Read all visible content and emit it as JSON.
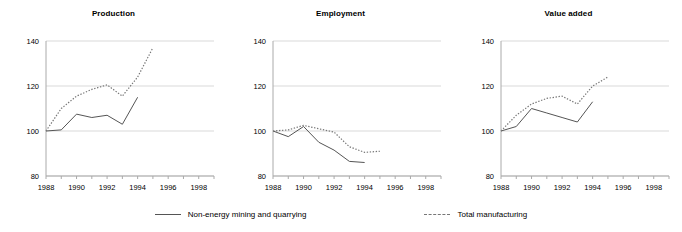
{
  "figure": {
    "background_color": "#ffffff",
    "series_colors": {
      "solid": "#555555",
      "dotted": "#777777",
      "grid": "#d9d9d9",
      "axis": "#aaaaaa"
    }
  },
  "legend": {
    "position": "bottom-center",
    "entries": [
      {
        "label": "Non-energy mining and quarrying",
        "style": "solid",
        "swatch_name": "solid-line-swatch"
      },
      {
        "label": "Total manufacturing",
        "style": "dashed",
        "swatch_name": "dashed-line-swatch"
      }
    ]
  },
  "chart_data": [
    {
      "type": "line",
      "title": "Production",
      "xlabel": "",
      "ylabel": "",
      "xlim": [
        1988,
        1999
      ],
      "ylim": [
        80,
        140
      ],
      "yticks": [
        80,
        100,
        120,
        140
      ],
      "xticks": [
        1988,
        1990,
        1992,
        1994,
        1996,
        1998
      ],
      "grid": true,
      "series": [
        {
          "name": "Non-energy mining and quarrying",
          "style": "solid",
          "x": [
            1988,
            1989,
            1990,
            1991,
            1992,
            1993,
            1994
          ],
          "values": [
            100,
            100.5,
            107.5,
            106,
            107,
            103,
            115
          ]
        },
        {
          "name": "Total manufacturing",
          "style": "dashed",
          "x": [
            1988,
            1989,
            1990,
            1991,
            1992,
            1993,
            1994,
            1995
          ],
          "values": [
            100,
            110,
            115.5,
            118.5,
            120.5,
            115.5,
            124,
            137
          ]
        }
      ]
    },
    {
      "type": "line",
      "title": "Employment",
      "xlabel": "",
      "ylabel": "",
      "xlim": [
        1988,
        1999
      ],
      "ylim": [
        80,
        140
      ],
      "yticks": [
        80,
        100,
        120,
        140
      ],
      "xticks": [
        1988,
        1990,
        1992,
        1994,
        1996,
        1998
      ],
      "grid": true,
      "series": [
        {
          "name": "Non-energy mining and quarrying",
          "style": "solid",
          "x": [
            1988,
            1989,
            1990,
            1991,
            1992,
            1993,
            1994
          ],
          "values": [
            100,
            97.5,
            102,
            95,
            91.5,
            86.5,
            86
          ]
        },
        {
          "name": "Total manufacturing",
          "style": "dashed",
          "x": [
            1988,
            1989,
            1990,
            1991,
            1992,
            1993,
            1994,
            1995
          ],
          "values": [
            100,
            100.5,
            102.5,
            101,
            99.5,
            93,
            90.5,
            91
          ]
        }
      ]
    },
    {
      "type": "line",
      "title": "Value added",
      "xlabel": "",
      "ylabel": "",
      "xlim": [
        1988,
        1999
      ],
      "ylim": [
        80,
        140
      ],
      "yticks": [
        80,
        100,
        120,
        140
      ],
      "xticks": [
        1988,
        1990,
        1992,
        1994,
        1996,
        1998
      ],
      "grid": true,
      "series": [
        {
          "name": "Non-energy mining and quarrying",
          "style": "solid",
          "x": [
            1988,
            1989,
            1990,
            1991,
            1992,
            1993,
            1994
          ],
          "values": [
            100,
            102,
            110,
            108,
            106,
            104,
            113
          ]
        },
        {
          "name": "Total manufacturing",
          "style": "dashed",
          "x": [
            1988,
            1989,
            1990,
            1991,
            1992,
            1993,
            1994,
            1995
          ],
          "values": [
            100,
            107,
            112,
            114.5,
            115.5,
            112,
            120,
            124
          ]
        }
      ]
    }
  ]
}
